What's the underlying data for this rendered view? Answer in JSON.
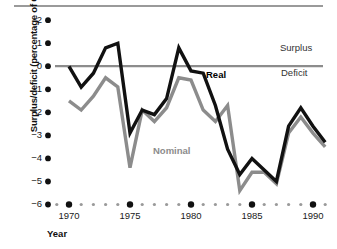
{
  "chart_data": {
    "type": "line",
    "title": "",
    "xlabel": "Year",
    "ylabel": "Surplus/deficit (percentage of GDP)",
    "xlim": [
      1969,
      1991
    ],
    "ylim": [
      -6,
      2
    ],
    "ytick_labels": [
      "2",
      "1",
      "0",
      "−1",
      "−2",
      "−3",
      "−4",
      "−5",
      "−6"
    ],
    "ytick_values": [
      2,
      1,
      0,
      -1,
      -2,
      -3,
      -4,
      -5,
      -6
    ],
    "xtick_labels": [
      "1970",
      "1975",
      "1980",
      "1985",
      "1990"
    ],
    "xtick_values": [
      1970,
      1975,
      1980,
      1985,
      1990
    ],
    "grid": false,
    "legend_position": "inline-annotations",
    "zero_line": 0,
    "x": [
      1970,
      1971,
      1972,
      1973,
      1974,
      1975,
      1976,
      1977,
      1978,
      1979,
      1980,
      1981,
      1982,
      1983,
      1984,
      1985,
      1986,
      1987,
      1988,
      1989,
      1990,
      1991
    ],
    "series": [
      {
        "name": "Real",
        "color": "#111111",
        "values": [
          0.0,
          -0.9,
          -0.3,
          0.8,
          1.0,
          -2.9,
          -1.9,
          -2.1,
          -1.4,
          0.8,
          -0.2,
          -0.3,
          -1.7,
          -3.6,
          -4.7,
          -4.0,
          -4.5,
          -5.0,
          -2.6,
          -1.8,
          -2.6,
          -3.3
        ]
      },
      {
        "name": "Nominal",
        "color": "#8c8c8c",
        "values": [
          -1.5,
          -1.9,
          -1.3,
          -0.5,
          -0.9,
          -4.4,
          -1.9,
          -2.4,
          -1.8,
          -0.5,
          -0.6,
          -1.9,
          -2.4,
          -1.7,
          -5.4,
          -4.6,
          -4.6,
          -5.1,
          -2.9,
          -2.2,
          -2.9,
          -3.5
        ]
      }
    ],
    "annotations": [
      {
        "text": "Surplus",
        "x": 1990.5,
        "y": 1.1
      },
      {
        "text": "Deficit",
        "x": 1990.5,
        "y": -0.1
      },
      {
        "text": "Real",
        "x": 1981.0,
        "y": -0.05
      },
      {
        "text": "Nominal",
        "x": 1977.3,
        "y": -3.4
      }
    ]
  },
  "axes": {
    "ylabel": "Surplus/deficit (percentage of GDP)",
    "xlabel": "Year"
  },
  "ticks": {
    "y": [
      {
        "label": "2",
        "top": 16
      },
      {
        "label": "1",
        "top": 39
      },
      {
        "label": "0",
        "top": 62
      },
      {
        "label": "−1",
        "top": 85
      },
      {
        "label": "−2",
        "top": 108
      },
      {
        "label": "−3",
        "top": 131
      },
      {
        "label": "−4",
        "top": 154
      },
      {
        "label": "−5",
        "top": 177
      },
      {
        "label": "−6",
        "top": 200
      }
    ],
    "x": [
      {
        "label": "1970",
        "left": 49
      },
      {
        "label": "1975",
        "left": 112
      },
      {
        "label": "1980",
        "left": 175
      },
      {
        "label": "1985",
        "left": 238
      },
      {
        "label": "1990",
        "left": 301
      }
    ]
  },
  "annotations": {
    "surplus": "Surplus",
    "deficit": "Deficit",
    "real": "Real",
    "nominal": "Nominal"
  },
  "colors": {
    "real_line": "#111111",
    "nominal_line": "#8c8c8c",
    "zero_line": "#8c8c8c",
    "tick_dot_major": "#111111",
    "tick_dot_minor": "#9a9a9a",
    "top_rule": "#9a9a9a"
  }
}
